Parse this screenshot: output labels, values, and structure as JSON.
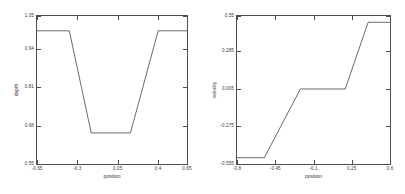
{
  "figure": {
    "background": "#ffffff",
    "line_color": "#585858",
    "axis_color": "#4d4d4d"
  },
  "chart_data": [
    {
      "type": "line",
      "title": "",
      "xlabel": "position",
      "ylabel": "depth",
      "xlim": [
        -0.65,
        0.65
      ],
      "ylim": [
        0.55,
        1.05
      ],
      "xticks": [
        "-0.65",
        "-0.3",
        "0.05",
        "0.4",
        "0.65"
      ],
      "xtick_values": [
        -0.65,
        -0.3,
        0.05,
        0.4,
        0.65
      ],
      "yticks": [
        "0.55",
        "0.68",
        "0.81",
        "0.94",
        "1.05"
      ],
      "ytick_values": [
        0.55,
        0.68,
        0.81,
        0.94,
        1.05
      ],
      "grid": false,
      "legend": false,
      "series": [
        {
          "name": "depth",
          "x": [
            -0.65,
            -0.37,
            -0.18,
            0.16,
            0.4,
            0.65
          ],
          "y": [
            1.0,
            1.0,
            0.655,
            0.655,
            1.0,
            1.0
          ]
        }
      ]
    },
    {
      "type": "line",
      "title": "",
      "xlabel": "position",
      "ylabel": "velocity",
      "xlim": [
        -0.8,
        0.6
      ],
      "ylim": [
        -0.555,
        0.55
      ],
      "xticks": [
        "-0.8",
        "-0.45",
        "-0.1",
        "0.25",
        "0.6"
      ],
      "xtick_values": [
        -0.8,
        -0.45,
        -0.1,
        0.25,
        0.6
      ],
      "yticks": [
        "-0.555",
        "-0.275",
        "0.005",
        "0.285",
        "0.55"
      ],
      "ytick_values": [
        -0.555,
        -0.275,
        0.005,
        0.285,
        0.55
      ],
      "grid": false,
      "legend": false,
      "series": [
        {
          "name": "velocity",
          "x": [
            -0.8,
            -0.55,
            -0.22,
            0.19,
            0.4,
            0.6
          ],
          "y": [
            -0.508,
            -0.508,
            0.005,
            0.005,
            0.503,
            0.503
          ]
        }
      ]
    }
  ]
}
